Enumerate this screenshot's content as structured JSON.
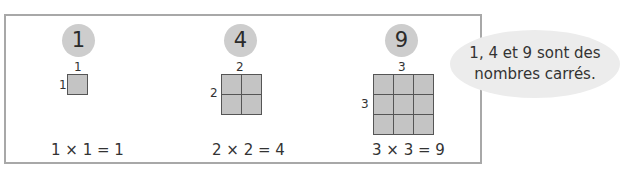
{
  "examples": [
    {
      "square_number": "1",
      "side_top": "1",
      "side_left": "1",
      "equation": "1 × 1 = 1",
      "grid_size": 1
    },
    {
      "square_number": "4",
      "side_top": "2",
      "side_left": "2",
      "equation": "2 × 2 = 4",
      "grid_size": 2
    },
    {
      "square_number": "9",
      "side_top": "3",
      "side_left": "3",
      "equation": "3 × 3 = 9",
      "grid_size": 3
    }
  ],
  "bubble": {
    "line1": "1, 4 et 9 sont des",
    "line2": "nombres carrés."
  },
  "colors": {
    "circle": "#cdcdcd",
    "cell": "#c4c4c4",
    "grid_line": "#555555",
    "frame": "#a8a8a8",
    "bubble": "#ececec"
  }
}
